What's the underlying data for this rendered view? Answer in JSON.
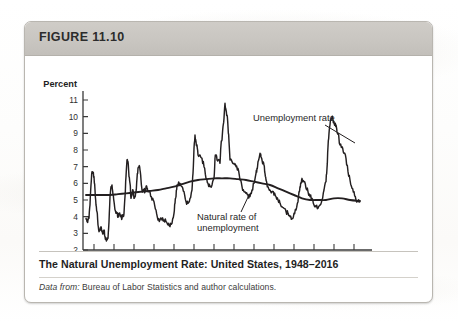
{
  "figure": {
    "label": "FIGURE 11.10",
    "caption_title": "The Natural Unemployment Rate: United States, 1948–2016",
    "source_prefix": "Data from:",
    "source_rest": " Bureau of Labor Statistics and author calculations."
  },
  "colors": {
    "card_border": "#b9b6b0",
    "header_bar": "#c9c6c1",
    "line": "#231f20",
    "axis": "#3a3a3a",
    "page": "#ffffff"
  },
  "chart_data": {
    "type": "line",
    "title": "The Natural Unemployment Rate: United States, 1948–2016",
    "xlabel": "Year",
    "ylabel": "Percent",
    "xlim": [
      1948,
      2017
    ],
    "ylim": [
      2,
      11
    ],
    "grid": false,
    "legend": "annotations",
    "y_ticks": [
      2,
      3,
      4,
      5,
      6,
      7,
      8,
      9,
      10,
      11
    ],
    "x_ticks": [
      1950,
      1955,
      1960,
      1965,
      1970,
      1975,
      1980,
      1985,
      1990,
      1995,
      2000,
      2005,
      2010,
      2015
    ],
    "annotations": [
      {
        "name": "unemployment-rate",
        "text": "Unemployment rate",
        "x": 1993,
        "y": 9.0
      },
      {
        "name": "natural-rate",
        "text": "Natural rate of\nunemployment",
        "x": 1978,
        "y": 4.0
      }
    ],
    "series": [
      {
        "name": "Unemployment rate",
        "x": [
          1948.0,
          1948.25,
          1948.5,
          1948.75,
          1949.0,
          1949.25,
          1949.5,
          1949.75,
          1950.0,
          1950.25,
          1950.5,
          1950.75,
          1951.0,
          1951.25,
          1951.5,
          1951.75,
          1952.0,
          1952.25,
          1952.5,
          1952.75,
          1953.0,
          1953.25,
          1953.5,
          1953.75,
          1954.0,
          1954.25,
          1954.5,
          1954.75,
          1955.0,
          1955.25,
          1955.5,
          1955.75,
          1956.0,
          1956.25,
          1956.5,
          1956.75,
          1957.0,
          1957.25,
          1957.5,
          1957.75,
          1958.0,
          1958.25,
          1958.5,
          1958.75,
          1959.0,
          1959.25,
          1959.5,
          1959.75,
          1960.0,
          1960.25,
          1960.5,
          1960.75,
          1961.0,
          1961.25,
          1961.5,
          1961.75,
          1962.0,
          1962.25,
          1962.5,
          1962.75,
          1963.0,
          1963.25,
          1963.5,
          1963.75,
          1964.0,
          1964.5,
          1965.0,
          1965.5,
          1966.0,
          1966.5,
          1967.0,
          1967.5,
          1968.0,
          1968.5,
          1969.0,
          1969.5,
          1970.0,
          1970.25,
          1970.5,
          1970.75,
          1971.0,
          1971.5,
          1972.0,
          1972.5,
          1973.0,
          1973.5,
          1974.0,
          1974.5,
          1974.75,
          1975.0,
          1975.25,
          1975.5,
          1975.75,
          1976.0,
          1976.5,
          1977.0,
          1977.5,
          1978.0,
          1978.5,
          1979.0,
          1979.5,
          1980.0,
          1980.25,
          1980.5,
          1980.75,
          1981.0,
          1981.5,
          1981.75,
          1982.0,
          1982.25,
          1982.5,
          1982.75,
          1983.0,
          1983.25,
          1983.5,
          1983.75,
          1984.0,
          1984.5,
          1985.0,
          1985.5,
          1986.0,
          1986.5,
          1987.0,
          1987.5,
          1988.0,
          1988.5,
          1989.0,
          1989.5,
          1990.0,
          1990.5,
          1990.75,
          1991.0,
          1991.5,
          1991.75,
          1992.0,
          1992.5,
          1992.75,
          1993.0,
          1993.5,
          1994.0,
          1994.5,
          1995.0,
          1995.5,
          1996.0,
          1996.5,
          1997.0,
          1997.5,
          1998.0,
          1998.5,
          1999.0,
          1999.5,
          2000.0,
          2000.5,
          2001.0,
          2001.25,
          2001.5,
          2001.75,
          2002.0,
          2002.5,
          2003.0,
          2003.5,
          2004.0,
          2004.5,
          2005.0,
          2005.5,
          2006.0,
          2006.5,
          2007.0,
          2007.5,
          2008.0,
          2008.25,
          2008.5,
          2008.75,
          2009.0,
          2009.25,
          2009.5,
          2009.75,
          2010.0,
          2010.25,
          2010.5,
          2010.75,
          2011.0,
          2011.5,
          2012.0,
          2012.5,
          2013.0,
          2013.5,
          2014.0,
          2014.5,
          2015.0,
          2015.5,
          2016.0,
          2016.5
        ],
        "y": [
          3.9,
          3.7,
          3.8,
          3.9,
          4.7,
          5.9,
          6.7,
          6.6,
          6.4,
          5.6,
          4.7,
          4.3,
          3.5,
          3.1,
          3.2,
          3.4,
          3.1,
          3.0,
          3.2,
          2.8,
          2.7,
          2.6,
          2.7,
          3.7,
          5.2,
          5.8,
          5.9,
          5.3,
          4.9,
          4.4,
          4.2,
          4.2,
          4.0,
          4.2,
          4.1,
          4.1,
          3.9,
          4.1,
          4.2,
          5.2,
          6.4,
          7.4,
          7.3,
          6.4,
          6.0,
          5.1,
          5.3,
          5.6,
          5.1,
          5.2,
          5.5,
          6.3,
          6.9,
          7.0,
          6.8,
          6.2,
          5.6,
          5.5,
          5.6,
          5.5,
          5.8,
          5.7,
          5.5,
          5.5,
          5.5,
          5.0,
          4.9,
          4.4,
          3.8,
          3.8,
          3.8,
          3.8,
          3.7,
          3.5,
          3.4,
          3.6,
          4.2,
          4.8,
          5.2,
          5.9,
          5.9,
          6.0,
          5.8,
          5.5,
          4.9,
          4.8,
          5.1,
          5.6,
          6.6,
          8.1,
          8.9,
          8.5,
          8.3,
          7.7,
          7.7,
          7.5,
          7.0,
          6.3,
          6.0,
          5.8,
          5.9,
          6.3,
          7.5,
          7.7,
          7.4,
          7.4,
          7.2,
          8.3,
          8.6,
          9.4,
          9.9,
          10.8,
          10.4,
          10.1,
          9.4,
          8.5,
          7.4,
          7.3,
          7.2,
          7.0,
          6.9,
          6.2,
          5.8,
          5.5,
          5.4,
          5.3,
          5.2,
          5.6,
          6.0,
          6.6,
          6.9,
          7.3,
          7.8,
          7.6,
          7.4,
          7.1,
          6.6,
          6.2,
          5.8,
          5.6,
          5.5,
          5.3,
          5.2,
          5.0,
          4.8,
          4.6,
          4.5,
          4.3,
          4.2,
          4.0,
          3.9,
          4.2,
          4.4,
          4.9,
          5.5,
          5.8,
          6.0,
          6.3,
          6.1,
          5.7,
          5.5,
          5.2,
          5.1,
          4.7,
          4.6,
          4.5,
          4.7,
          5.0,
          5.6,
          6.1,
          6.9,
          8.2,
          9.0,
          9.5,
          9.8,
          10.0,
          9.8,
          9.7,
          9.5,
          9.5,
          9.1,
          9.0,
          8.3,
          8.2,
          7.8,
          7.5,
          6.7,
          6.2,
          5.7,
          5.5,
          5.0,
          4.9,
          4.9
        ],
        "style": "jagged",
        "peaks": [
          {
            "year": 1949,
            "value": 6.7
          },
          {
            "year": 1954,
            "value": 5.9
          },
          {
            "year": 1958,
            "value": 7.4
          },
          {
            "year": 1961,
            "value": 7.0
          },
          {
            "year": 1975,
            "value": 8.9
          },
          {
            "year": 1982,
            "value": 10.8
          },
          {
            "year": 1992,
            "value": 7.8
          },
          {
            "year": 2009,
            "value": 10.0
          }
        ],
        "troughs": [
          {
            "year": 1953,
            "value": 2.6
          },
          {
            "year": 1969,
            "value": 3.4
          },
          {
            "year": 2000,
            "value": 3.9
          },
          {
            "year": 2007,
            "value": 4.5
          }
        ]
      },
      {
        "name": "Natural rate of unemployment",
        "x": [
          1948,
          1950,
          1952,
          1954,
          1956,
          1958,
          1960,
          1962,
          1964,
          1966,
          1968,
          1970,
          1972,
          1974,
          1976,
          1978,
          1980,
          1982,
          1984,
          1986,
          1988,
          1990,
          1992,
          1994,
          1996,
          1998,
          2000,
          2002,
          2004,
          2006,
          2008,
          2010,
          2012,
          2014,
          2016,
          2016.5
        ],
        "y": [
          5.3,
          5.3,
          5.3,
          5.3,
          5.35,
          5.4,
          5.45,
          5.5,
          5.55,
          5.6,
          5.7,
          5.8,
          5.95,
          6.1,
          6.2,
          6.25,
          6.3,
          6.3,
          6.3,
          6.25,
          6.2,
          6.1,
          6.0,
          5.9,
          5.7,
          5.5,
          5.3,
          5.1,
          5.0,
          5.0,
          5.0,
          5.1,
          5.1,
          5.0,
          4.95,
          4.95
        ],
        "style": "smooth"
      }
    ]
  }
}
